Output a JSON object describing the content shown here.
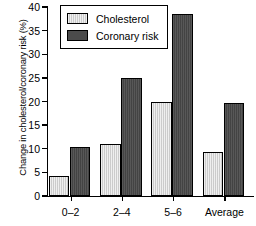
{
  "chart_data": {
    "type": "bar",
    "title": "",
    "xlabel": "",
    "ylabel": "Change in cholesterol/coronary risk (%)",
    "categories": [
      "0–2",
      "2–4",
      "5–6",
      "Average"
    ],
    "series": [
      {
        "name": "Cholesterol",
        "color": "#d2d2d2",
        "values": [
          4.3,
          11.1,
          19.9,
          9.3
        ]
      },
      {
        "name": "Coronary risk",
        "color": "#4b4b4b",
        "values": [
          10.4,
          25.0,
          38.5,
          19.7
        ]
      }
    ],
    "ylim": [
      0,
      40
    ],
    "yticks": [
      0,
      5,
      10,
      15,
      20,
      25,
      30,
      35,
      40
    ],
    "ytick_labels": [
      "0",
      "5",
      "10",
      "15",
      "20",
      "25",
      "30",
      "35",
      "40"
    ],
    "grid": false,
    "legend_position": "top-left",
    "legend_entries": [
      "Cholesterol",
      "Coronary risk"
    ]
  }
}
